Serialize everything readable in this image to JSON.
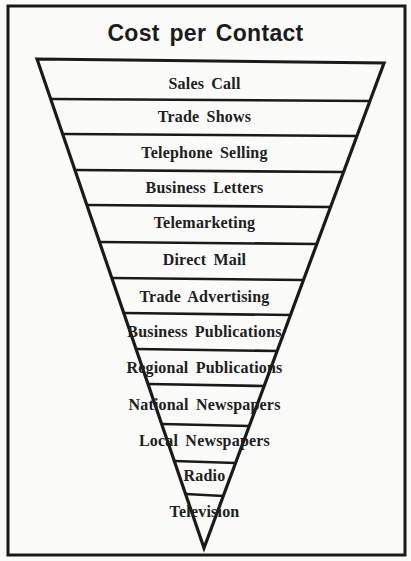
{
  "diagram": {
    "title": "Cost per Contact",
    "type": "inverted-funnel",
    "colors": {
      "stroke": "#1a1a1a",
      "background": "#fbfbfa",
      "text": "#202020"
    },
    "frame": {
      "x1": 8,
      "y1": 6,
      "x2": 405,
      "y2": 555
    },
    "funnel": {
      "top_left": [
        37,
        59
      ],
      "top_right": [
        384,
        63
      ],
      "apex": [
        204,
        548
      ]
    },
    "levels": [
      {
        "label": "Sales Call",
        "line_y": 99,
        "text_y": 75
      },
      {
        "label": "Trade Shows",
        "line_y": 134,
        "text_y": 108
      },
      {
        "label": "Telephone Selling",
        "line_y": 170,
        "text_y": 144
      },
      {
        "label": "Business Letters",
        "line_y": 205,
        "text_y": 179
      },
      {
        "label": "Telemarketing",
        "line_y": 242,
        "text_y": 214
      },
      {
        "label": "Direct Mail",
        "line_y": 278,
        "text_y": 251
      },
      {
        "label": "Trade Advertising",
        "line_y": 313,
        "text_y": 288
      },
      {
        "label": "Business Publications",
        "line_y": 349,
        "text_y": 323
      },
      {
        "label": "Regional Publications",
        "line_y": 384,
        "text_y": 359
      },
      {
        "label": "National Newspapers",
        "line_y": 424,
        "text_y": 396
      },
      {
        "label": "Local Newspapers",
        "line_y": 461,
        "text_y": 432
      },
      {
        "label": "Radio",
        "line_y": 494,
        "text_y": 467
      },
      {
        "label": "Television",
        "line_y": null,
        "text_y": 503
      }
    ]
  }
}
